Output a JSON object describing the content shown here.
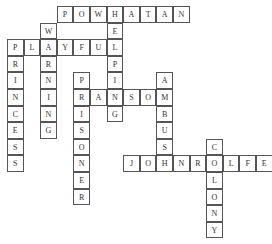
{
  "puzzle": {
    "cell_size": 16.6,
    "words": [
      {
        "word": "POWHATAN",
        "row": 0,
        "col": 3,
        "dir": "across"
      },
      {
        "word": "WARNING",
        "row": 1,
        "col": 2,
        "dir": "down"
      },
      {
        "word": "PLAYFUL",
        "row": 2,
        "col": 0,
        "dir": "across"
      },
      {
        "word": "HELPING",
        "row": 0,
        "col": 6,
        "dir": "down"
      },
      {
        "word": "PRINCESS",
        "row": 2,
        "col": 0,
        "dir": "down"
      },
      {
        "word": "PRISONER",
        "row": 4,
        "col": 4,
        "dir": "down"
      },
      {
        "word": "RANSOM",
        "row": 5,
        "col": 4,
        "dir": "across"
      },
      {
        "word": "AMBUSH",
        "row": 4,
        "col": 9,
        "dir": "down"
      },
      {
        "word": "JOHNROLFE",
        "row": 9,
        "col": 7,
        "dir": "across"
      },
      {
        "word": "COLONY",
        "row": 8,
        "col": 12,
        "dir": "down"
      }
    ]
  }
}
